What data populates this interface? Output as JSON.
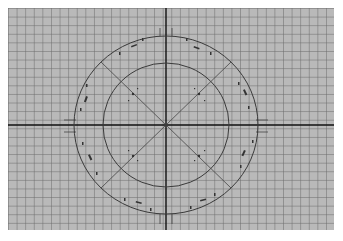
{
  "diagram": {
    "type": "concentric-circles-on-graph-paper",
    "colors": {
      "paper": "#b9b9b9",
      "grid": "#7a7a7a",
      "axis": "#111111",
      "circle": "#3a3a3a",
      "background": "#ffffff"
    },
    "center": {
      "x": 166,
      "y": 125
    },
    "outer_circle": {
      "rx": 92,
      "ry": 89
    },
    "inner_circle": {
      "rx": 63,
      "ry": 62
    },
    "axes": [
      "horizontal",
      "vertical"
    ],
    "diagonals": [
      "45deg",
      "135deg"
    ],
    "annotations": {
      "note": "small illegible handwritten tick labels around the outer circle and along diagonals",
      "outer_ticks_deg": [
        -90,
        -70,
        -60,
        -50,
        -20,
        -5,
        5,
        20,
        30,
        50,
        60,
        70,
        90,
        110,
        120,
        130,
        160,
        175,
        185,
        200,
        210,
        230,
        240,
        250
      ]
    }
  }
}
